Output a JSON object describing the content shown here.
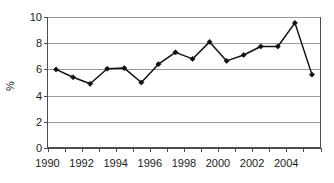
{
  "chart_data": {
    "type": "line",
    "title": "",
    "subtitle": "",
    "xlabel": "",
    "ylabel": "%",
    "x": [
      1990,
      1991,
      1992,
      1993,
      1994,
      1995,
      1996,
      1997,
      1998,
      1999,
      2000,
      2001,
      2002,
      2003,
      2004,
      2005
    ],
    "values": [
      6.0,
      5.4,
      4.9,
      6.05,
      6.1,
      5.0,
      6.4,
      7.3,
      6.8,
      8.1,
      6.65,
      7.1,
      7.75,
      7.75,
      9.55,
      5.6
    ],
    "series": [
      {
        "name": "",
        "values": [
          6.0,
          5.4,
          4.9,
          6.05,
          6.1,
          5.0,
          6.4,
          7.3,
          6.8,
          8.1,
          6.65,
          7.1,
          7.75,
          7.75,
          9.55,
          5.6
        ]
      }
    ],
    "xlim": [
      1990,
      2006
    ],
    "ylim": [
      0,
      10
    ],
    "y_ticks": [
      0,
      2,
      4,
      6,
      8,
      10
    ],
    "y_tick_labels": [
      "0",
      "2",
      "4",
      "6",
      "8",
      "10"
    ],
    "x_ticks": [
      1990,
      1991,
      1992,
      1993,
      1994,
      1995,
      1996,
      1997,
      1998,
      1999,
      2000,
      2001,
      2002,
      2003,
      2004,
      2005,
      2006
    ],
    "x_tick_labels": [
      "1990",
      "",
      "1992",
      "",
      "1994",
      "",
      "1996",
      "",
      "1998",
      "",
      "2000",
      "",
      "2002",
      "",
      "2004",
      "",
      ""
    ],
    "x_labels_shown": [
      "1990",
      "1992",
      "1994",
      "1996",
      "1998",
      "2000",
      "2002",
      "2004"
    ],
    "grid": true,
    "grid_axis": "y",
    "legend": false,
    "legend_position": "none",
    "marker": "diamond",
    "line_color": "#111111",
    "marker_color": "#111111",
    "grid_color": "#9a9a9a",
    "axis_color": "#4d4d4d",
    "background_color": "#ffffff"
  },
  "axes": {
    "y_title": "%",
    "y_tick_0": "0",
    "y_tick_1": "2",
    "y_tick_2": "4",
    "y_tick_3": "6",
    "y_tick_4": "8",
    "y_tick_5": "10",
    "x_tick_1990": "1990",
    "x_tick_1992": "1992",
    "x_tick_1994": "1994",
    "x_tick_1996": "1996",
    "x_tick_1998": "1998",
    "x_tick_2000": "2000",
    "x_tick_2002": "2002",
    "x_tick_2004": "2004"
  }
}
